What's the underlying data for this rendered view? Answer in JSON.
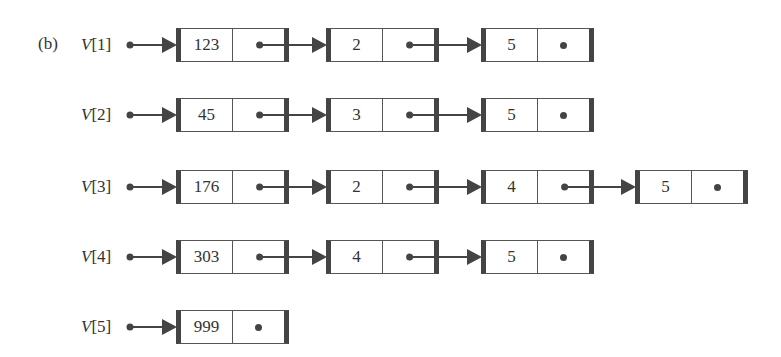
{
  "figure_label": "(b)",
  "rows": [
    {
      "var": "V",
      "index": "[1]",
      "nodes": [
        "123",
        "2",
        "5"
      ]
    },
    {
      "var": "V",
      "index": "[2]",
      "nodes": [
        "45",
        "3",
        "5"
      ]
    },
    {
      "var": "V",
      "index": "[3]",
      "nodes": [
        "176",
        "2",
        "4",
        "5"
      ]
    },
    {
      "var": "V",
      "index": "[4]",
      "nodes": [
        "303",
        "4",
        "5"
      ]
    },
    {
      "var": "V",
      "index": "[5]",
      "nodes": [
        "999"
      ]
    }
  ],
  "colors": {
    "line": "#444444",
    "text": "#333333"
  }
}
